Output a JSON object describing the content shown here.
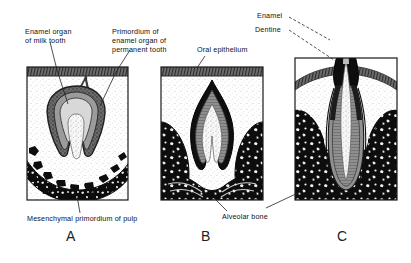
{
  "figure": {
    "background_color": "#ffffff",
    "ink_color": "#111111"
  },
  "labels": {
    "enamel_organ_milk_tooth": "Enamel organ\nof milk tooth",
    "primordium_permanent": "Primordium of\nenamel organ of\npermanent tooth",
    "oral_epithelium": "Oral epithelium",
    "enamel": "Enamel",
    "dentine": "Dentine",
    "mesenchymal_primordium": "Mesenchymal primordium of pulp",
    "alveolar_bone": "Alveolar bone"
  },
  "panels": [
    {
      "letter": "A",
      "stage": "bell-stage-tooth-germ",
      "features": [
        "oral epithelium",
        "dental lamina",
        "enamel organ of milk tooth",
        "primordium of enamel organ of permanent tooth",
        "mesenchymal primordium of pulp",
        "alveolar bone"
      ]
    },
    {
      "letter": "B",
      "stage": "crown-formation",
      "features": [
        "oral epithelium",
        "enamel",
        "dentine",
        "pulp",
        "alveolar bone"
      ]
    },
    {
      "letter": "C",
      "stage": "erupting-tooth",
      "features": [
        "enamel",
        "dentine",
        "pulp canal",
        "alveolar bone",
        "gingiva"
      ]
    }
  ],
  "colors": {
    "enamel_dark": "#111111",
    "dentine_gray": "#8c8c8c",
    "pulp_light": "#f2f2f2",
    "bone_black": "#0d0d0d",
    "tissue_stipple": "#cfcfcf",
    "epithelium_band": "#5c5c5c"
  }
}
